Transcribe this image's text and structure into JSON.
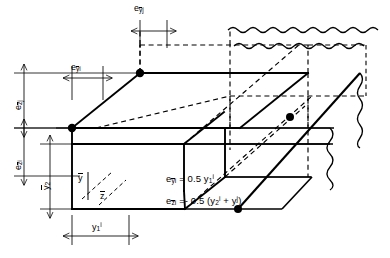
{
  "figure": {
    "type": "engineering-eccentricity-diagram",
    "ink_color": "#000000",
    "background_color": "#ffffff"
  },
  "labels": {
    "e_y_bar_j": "e",
    "e_y_bar_j_sub": "y",
    "e_y_bar_j_sub2": "j",
    "e_y_bar_i": "e",
    "e_y_bar_i_sub": "y",
    "e_y_bar_i_sub2": "i",
    "e_z_bar_j": "e",
    "e_z_bar_j_sub": "z",
    "e_z_bar_j_sub2": "j",
    "e_z_bar_i": "e",
    "e_z_bar_i_sub": "z",
    "e_z_bar_i_sub2": "i",
    "y2": "y",
    "y2_sub": "2",
    "y1_i": "y",
    "y1_i_sub": "1",
    "y1_i_sup": "i",
    "axis_y_bar": "y",
    "axis_z_bar": "z"
  },
  "equations": {
    "eq1": {
      "lhs": "e",
      "lhs_sub_var": "y",
      "lhs_sub_idx": "i",
      "equals": "=",
      "rhs_coef": "0.5",
      "rhs_var": "y",
      "rhs_sub": "1",
      "rhs_sup": "i"
    },
    "eq2": {
      "lhs": "e",
      "lhs_sub_var": "z",
      "lhs_sub_idx": "i",
      "equals": "=",
      "sign": "-",
      "rhs_coef": "0.5",
      "open": "(",
      "term1_var": "y",
      "term1_sub": "2",
      "term1_sup": "i",
      "plus": "+",
      "term2_var": "y",
      "term2_sup": "j",
      "close": ")"
    }
  }
}
